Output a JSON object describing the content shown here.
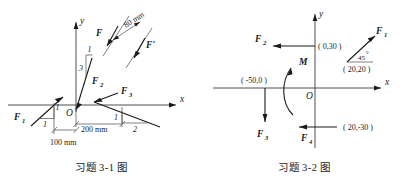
{
  "figure_left": {
    "caption": "习题 3-1 图",
    "axes": {
      "x_label": "x",
      "y_label": "y",
      "origin_label": "O"
    },
    "forces": [
      {
        "name": "F1",
        "label": "F",
        "subscript": "1",
        "slope_rise": "1",
        "slope_run": "1"
      },
      {
        "name": "F2",
        "label": "F",
        "subscript": "2",
        "slope_rise": "1",
        "slope_run": "3"
      },
      {
        "name": "F3",
        "label": "F",
        "subscript": "3",
        "slope_rise": "1",
        "slope_run": "2"
      },
      {
        "name": "F_couple_a",
        "label": "F",
        "subscript": ""
      },
      {
        "name": "F_couple_b",
        "label": "F'",
        "subscript": ""
      }
    ],
    "dimensions": [
      {
        "name": "dim-100",
        "text": "100 mm"
      },
      {
        "name": "dim-200",
        "text": "200 mm"
      },
      {
        "name": "dim-80",
        "text": "80 mm"
      }
    ]
  },
  "figure_right": {
    "caption": "习题 3-2 图",
    "axes": {
      "x_label": "x",
      "y_label": "y",
      "origin_label": "O"
    },
    "moment": {
      "label": "M"
    },
    "forces": [
      {
        "name": "F1",
        "label": "F",
        "subscript": "1"
      },
      {
        "name": "F2",
        "label": "F",
        "subscript": "2"
      },
      {
        "name": "F3",
        "label": "F",
        "subscript": "3"
      },
      {
        "name": "F4",
        "label": "F",
        "subscript": "4"
      }
    ],
    "angle": {
      "text": "45",
      "unit": "°"
    },
    "coordinates": [
      {
        "name": "point-0-30",
        "text": "( 0,30 )"
      },
      {
        "name": "point-20-20",
        "text": "( 20,20 )"
      },
      {
        "name": "point-m50-0",
        "text": "( -50,0 )"
      },
      {
        "name": "point-20-m30",
        "text": "( 20,-30 )"
      }
    ]
  },
  "colors": {
    "ink": "#1a1a1a",
    "line": "#2b2b2b",
    "background": "#ffffff"
  }
}
